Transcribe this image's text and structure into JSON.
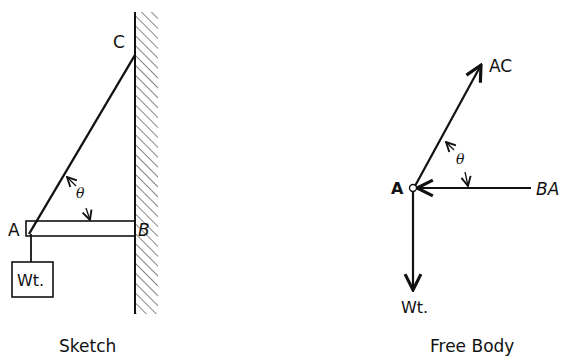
{
  "sketch": {
    "caption": "Sketch",
    "labels": {
      "c": "C",
      "a": "A",
      "b": "B",
      "angle": "θ",
      "weight": "Wt."
    }
  },
  "free_body": {
    "caption": "Free Body",
    "labels": {
      "point": "A",
      "ac": "AC",
      "ba": "BA",
      "angle": "θ",
      "weight": "Wt."
    }
  },
  "colors": {
    "ink": "#111111",
    "background": "#ffffff"
  }
}
